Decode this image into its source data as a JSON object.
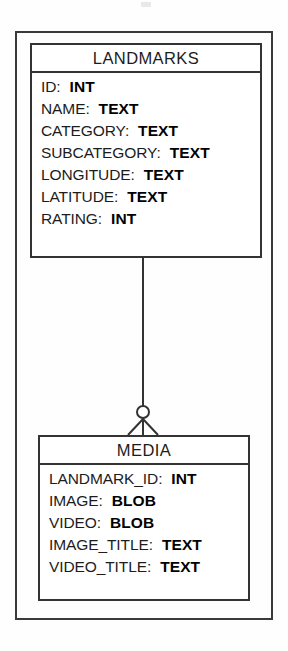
{
  "diagram": {
    "type": "entity-relationship-diagram",
    "notation": "crow's-foot",
    "colors": {
      "background": "#fefefe",
      "line": "#333333",
      "outer_frame": "#3a3a3a",
      "text": "#1c1c1c"
    },
    "entities": [
      {
        "name": "LANDMARKS",
        "attributes": [
          {
            "name": "ID:",
            "type": "INT"
          },
          {
            "name": "NAME:",
            "type": "TEXT"
          },
          {
            "name": "CATEGORY:",
            "type": "TEXT"
          },
          {
            "name": "SUBCATEGORY:",
            "type": "TEXT"
          },
          {
            "name": "LONGITUDE:",
            "type": "TEXT"
          },
          {
            "name": "LATITUDE:",
            "type": "TEXT"
          },
          {
            "name": "RATING:",
            "type": "INT"
          }
        ]
      },
      {
        "name": "MEDIA",
        "attributes": [
          {
            "name": "LANDMARK_ID:",
            "type": "INT"
          },
          {
            "name": "IMAGE:",
            "type": "BLOB"
          },
          {
            "name": "VIDEO:",
            "type": "BLOB"
          },
          {
            "name": "IMAGE_TITLE:",
            "type": "TEXT"
          },
          {
            "name": "VIDEO_TITLE:",
            "type": "TEXT"
          }
        ]
      }
    ],
    "relationship": {
      "from": "LANDMARKS",
      "to": "MEDIA",
      "from_cardinality": "one",
      "to_cardinality": "zero-or-many",
      "marker": "crows-foot-with-circle"
    }
  }
}
